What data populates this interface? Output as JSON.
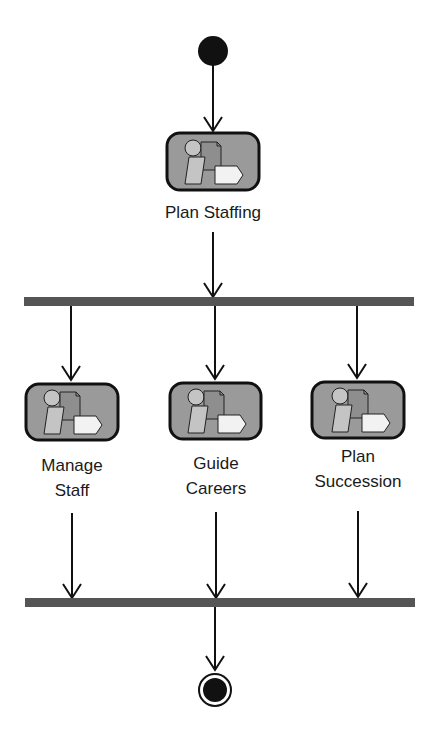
{
  "diagram": {
    "type": "uml-activity",
    "colors": {
      "line": "#111111",
      "bar": "#555555",
      "activity_fill": "#9a9a9a",
      "activity_border": "#111111",
      "icon_light": "#c8c8c8",
      "icon_white": "#f2f2f2"
    },
    "start_node": {
      "label": "start"
    },
    "activities": [
      {
        "id": "plan-staffing",
        "label_lines": [
          "Plan Staffing"
        ]
      },
      {
        "id": "manage-staff",
        "label_lines": [
          "Manage",
          "Staff"
        ]
      },
      {
        "id": "guide-careers",
        "label_lines": [
          "Guide",
          "Careers"
        ]
      },
      {
        "id": "plan-succession",
        "label_lines": [
          "Plan",
          "Succession"
        ]
      }
    ],
    "fork_bar": {
      "label": "fork"
    },
    "join_bar": {
      "label": "join"
    },
    "end_node": {
      "label": "end"
    },
    "edges": [
      {
        "from": "start",
        "to": "plan-staffing"
      },
      {
        "from": "plan-staffing",
        "to": "fork"
      },
      {
        "from": "fork",
        "to": "manage-staff"
      },
      {
        "from": "fork",
        "to": "guide-careers"
      },
      {
        "from": "fork",
        "to": "plan-succession"
      },
      {
        "from": "manage-staff",
        "to": "join"
      },
      {
        "from": "guide-careers",
        "to": "join"
      },
      {
        "from": "plan-succession",
        "to": "join"
      },
      {
        "from": "join",
        "to": "end"
      }
    ]
  }
}
